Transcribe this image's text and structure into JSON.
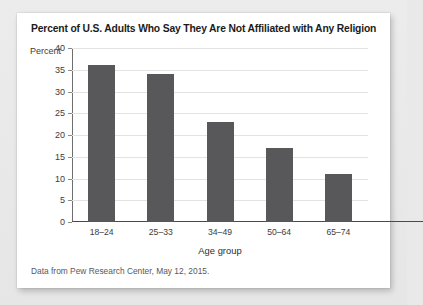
{
  "card": {
    "title": "Percent of U.S. Adults Who Say They Are Not Affiliated with Any Religion",
    "source_note": "Data from Pew Research Center, May 12, 2015."
  },
  "chart_data": {
    "type": "bar",
    "title": "Percent of U.S. Adults Who Say They Are Not Affiliated with Any Religion",
    "categories": [
      "18–24",
      "25–33",
      "34–49",
      "50–64",
      "65–74"
    ],
    "values": [
      36,
      34,
      23,
      17,
      11
    ],
    "xlabel": "Age group",
    "ylabel": "Percent",
    "ylim": [
      0,
      40
    ],
    "yticks": [
      0,
      5,
      10,
      15,
      20,
      25,
      30,
      35,
      40
    ],
    "ytick_labels": [
      "0",
      "5",
      "10",
      "15",
      "20",
      "25",
      "30",
      "35",
      "40"
    ],
    "grid": true,
    "legend": false,
    "bar_color": "#58585a",
    "gridline_color": "#e3e3e3",
    "source": "Data from Pew Research Center, May 12, 2015."
  }
}
